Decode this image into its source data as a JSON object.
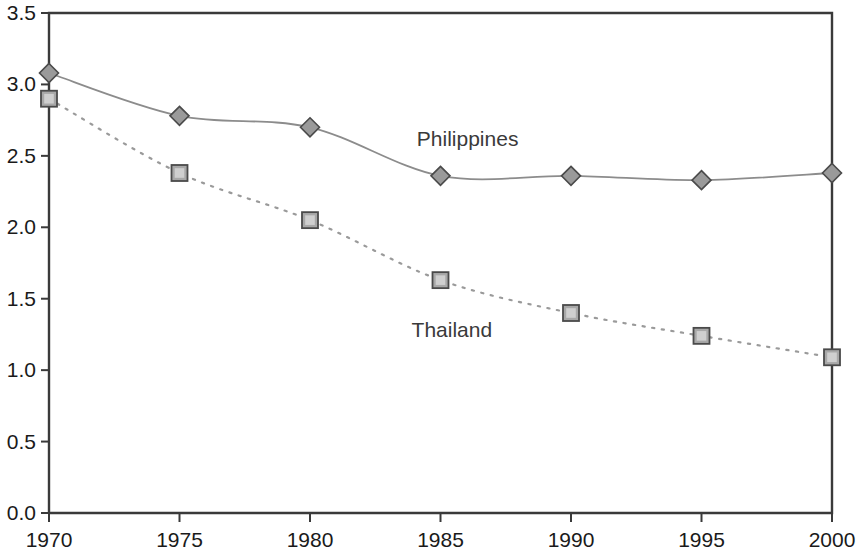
{
  "chart_data": {
    "type": "line",
    "title": "",
    "subtitle": "",
    "xlabel": "",
    "ylabel": "",
    "x": [
      1970,
      1975,
      1980,
      1985,
      1990,
      1995,
      2000
    ],
    "xtick_labels": [
      "1970",
      "1975",
      "1980",
      "1985",
      "1990",
      "1995",
      "2000"
    ],
    "ytick_labels": [
      "0.0",
      "0.5",
      "1.0",
      "1.5",
      "2.0",
      "2.5",
      "3.0",
      "3.5"
    ],
    "ytick_values": [
      0.0,
      0.5,
      1.0,
      1.5,
      2.0,
      2.5,
      3.0,
      3.5
    ],
    "xlim": [
      1970,
      2000
    ],
    "ylim": [
      0.0,
      3.5
    ],
    "grid": false,
    "legend_position": "inline-annotation",
    "series": [
      {
        "name": "Philippines",
        "values": [
          3.08,
          2.78,
          2.7,
          2.36,
          2.36,
          2.33,
          2.38
        ],
        "marker": "diamond",
        "line_style": "solid",
        "color": "#8c8c8c",
        "marker_fill": "#9a9a9a",
        "marker_stroke": "#4a4a4a",
        "label_x": 1986.2,
        "label_y": 2.62
      },
      {
        "name": "Thailand",
        "values": [
          2.9,
          2.38,
          2.05,
          1.63,
          1.4,
          1.24,
          1.09
        ],
        "marker": "square",
        "line_style": "dotted",
        "color": "#9a9a9a",
        "marker_fill": "#a8a8a8",
        "marker_stroke": "#4a4a4a",
        "label_x": 1986.0,
        "label_y": 1.28
      }
    ],
    "axis_color": "#3a3a3a",
    "plot_background": "#ffffff"
  }
}
